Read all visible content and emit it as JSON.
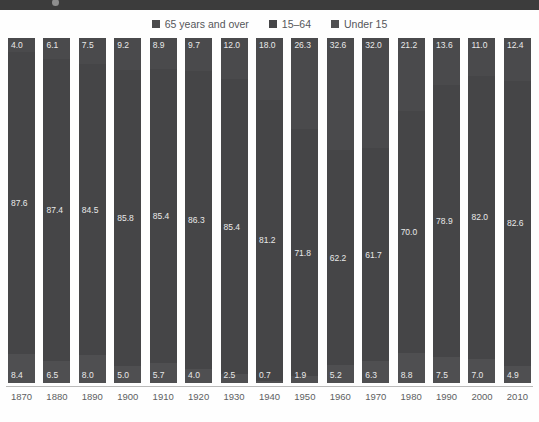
{
  "header": {
    "title": "",
    "dot_icon": "circle-icon"
  },
  "legend": {
    "position": "top-center",
    "items": [
      {
        "label": "65 years and over",
        "color": "#4a4a4c",
        "swatch_icon": "legend-swatch-icon"
      },
      {
        "label": "15–64",
        "color": "#454547",
        "swatch_icon": "legend-swatch-icon"
      },
      {
        "label": "Under 15",
        "color": "#4f4f51",
        "swatch_icon": "legend-swatch-icon"
      }
    ]
  },
  "footnote": {
    "text": ""
  },
  "chart_data": {
    "type": "bar",
    "subtype": "100% stacked column",
    "title": "",
    "subtitle": "",
    "xlabel": "",
    "ylabel": "",
    "ylim": [
      0,
      100
    ],
    "grid": false,
    "legend_position": "top-center",
    "categories": [
      "1870",
      "1880",
      "1890",
      "1900",
      "1910",
      "1920",
      "1930",
      "1940",
      "1950",
      "1960",
      "1970",
      "1980",
      "1990",
      "2000",
      "2010"
    ],
    "series": [
      {
        "name": "65 years and over",
        "color": "#4a4a4c",
        "values": [
          4.0,
          6.1,
          7.5,
          9.2,
          8.9,
          9.7,
          12.0,
          18.0,
          26.3,
          32.6,
          32.0,
          21.2,
          13.6,
          11.0,
          12.4
        ]
      },
      {
        "name": "15–64",
        "color": "#454547",
        "values": [
          87.6,
          87.4,
          84.5,
          85.8,
          85.4,
          86.3,
          85.4,
          81.2,
          71.8,
          62.2,
          61.7,
          70.0,
          78.9,
          82.0,
          82.6
        ]
      },
      {
        "name": "Under 15",
        "color": "#4f4f51",
        "values": [
          8.4,
          6.5,
          8.0,
          5.0,
          5.7,
          4.0,
          2.5,
          0.7,
          1.9,
          5.2,
          6.3,
          8.8,
          7.5,
          7.0,
          4.9
        ]
      }
    ]
  }
}
